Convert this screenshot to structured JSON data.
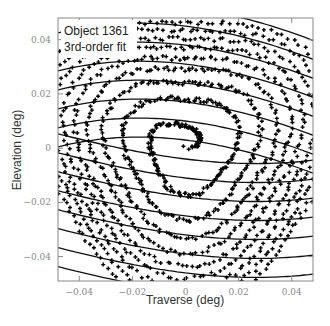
{
  "chart_data": {
    "type": "scatter",
    "title": "",
    "xlabel": "Traverse (deg)",
    "ylabel": "Elevation (deg)",
    "xlim": [
      -0.048,
      0.048
    ],
    "ylim": [
      -0.049,
      0.048
    ],
    "x_ticks": [
      -0.04,
      -0.02,
      0,
      0.02,
      0.04
    ],
    "x_tick_labels": [
      "−0.04",
      "−0.02",
      "0",
      "0.02",
      "0.04"
    ],
    "y_ticks": [
      -0.04,
      -0.02,
      0,
      0.02,
      0.04
    ],
    "y_tick_labels": [
      "−0.04",
      "−0.02",
      "0",
      "0.02",
      "0.04"
    ],
    "grid": false,
    "legend": {
      "placement": "top-left",
      "entries": [
        {
          "label": "Object 1361",
          "style": "points"
        },
        {
          "label": "3rd-order fit",
          "style": "line"
        }
      ]
    },
    "series": [
      {
        "name": "Object 1361",
        "kind": "spiral-scan-points",
        "marker": "plus",
        "color": "#000000",
        "center": [
          0.0,
          0.0
        ],
        "max_radius": 0.062,
        "turns": 9,
        "point_count": 1400
      },
      {
        "name": "3rd-order fit",
        "kind": "contour-lines",
        "color": "#111111",
        "levels": [
          0.052,
          0.045,
          0.038,
          0.031,
          0.024,
          0.017,
          0.01,
          0.003,
          -0.004,
          -0.011,
          -0.018,
          -0.025,
          -0.032,
          -0.039,
          -0.046,
          -0.053
        ],
        "tilt_coefficient": -0.12,
        "curvature": -3.2
      }
    ]
  }
}
